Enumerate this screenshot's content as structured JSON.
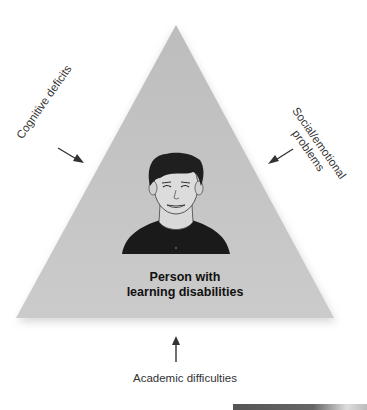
{
  "diagram": {
    "type": "triangle-influence-diagram",
    "center": {
      "line1": "Person with",
      "line2": "learning disabilities"
    },
    "influences": [
      {
        "label": "Cognitive deficits",
        "position": "left"
      },
      {
        "label_line1": "Social/emotional",
        "label_line2": "problems",
        "position": "right"
      },
      {
        "label": "Academic difficulties",
        "position": "bottom"
      }
    ],
    "colors": {
      "triangle_fill": "#c8c8c8",
      "arrow": "#333333",
      "shirt": "#1a1a1a",
      "hair": "#1f1f1f"
    }
  }
}
